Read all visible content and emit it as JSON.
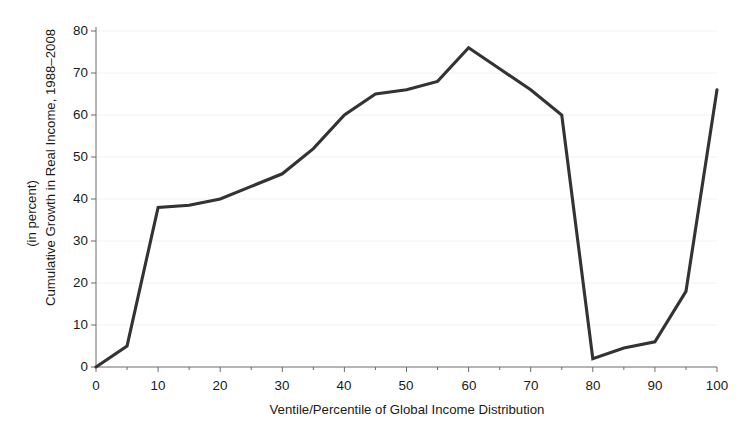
{
  "chart_data": {
    "type": "line",
    "title": "",
    "xlabel": "Ventile/Percentile of Global Income Distribution",
    "ylabel_line1": "Cumulative Growth in Real Income, 1988–2008",
    "ylabel_line2": "(in percent)",
    "x": [
      0,
      5,
      10,
      15,
      20,
      25,
      30,
      35,
      40,
      45,
      50,
      55,
      60,
      65,
      70,
      75,
      80,
      85,
      90,
      95,
      100
    ],
    "values": [
      0,
      5,
      38,
      38.5,
      40,
      43,
      46,
      52,
      60,
      65,
      66,
      68,
      76,
      71,
      66,
      60,
      2,
      4.5,
      6,
      18,
      66
    ],
    "series": [
      {
        "name": "Cumulative growth in real income",
        "values": [
          0,
          5,
          38,
          38.5,
          40,
          43,
          46,
          52,
          60,
          65,
          66,
          68,
          76,
          71,
          66,
          60,
          2,
          4.5,
          6,
          18,
          66
        ]
      }
    ],
    "xlim": [
      0,
      100
    ],
    "ylim": [
      0,
      80
    ],
    "xticks": [
      0,
      10,
      20,
      30,
      40,
      50,
      60,
      70,
      80,
      90,
      100
    ],
    "xtick_labels": [
      "0",
      "10",
      "20",
      "30",
      "40",
      "50",
      "60",
      "70",
      "80",
      "90",
      "100"
    ],
    "xminor_ticks": [
      5,
      15,
      25,
      35,
      45,
      55,
      65,
      75,
      85,
      95
    ],
    "yticks": [
      0,
      10,
      20,
      30,
      40,
      50,
      60,
      70,
      80
    ],
    "ytick_labels": [
      "0",
      "10",
      "20",
      "30",
      "40",
      "50",
      "60",
      "70",
      "80"
    ],
    "grid": "horizontal-faint",
    "legend": "none",
    "line_color": "#333333",
    "grid_color": "#f2f2f2",
    "axis_color": "#6b6b6b",
    "background_color": "#ffffff",
    "annotations": []
  }
}
